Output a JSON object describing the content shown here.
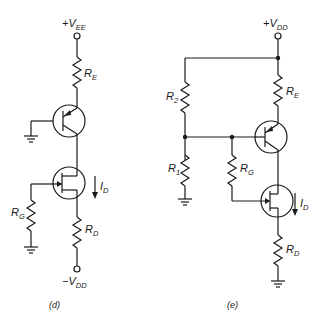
{
  "figure": {
    "type": "circuit-schematic",
    "colors": {
      "ink": "#1a1a1a",
      "background": "#ffffff"
    },
    "circuits": [
      {
        "id": "d",
        "caption": "(d)",
        "supply_top": {
          "main": "+V",
          "sub": "EE"
        },
        "supply_bottom": {
          "main": "−V",
          "sub": "DD"
        },
        "resistors": [
          {
            "main": "R",
            "sub": "E"
          },
          {
            "main": "R",
            "sub": "G"
          },
          {
            "main": "R",
            "sub": "D"
          }
        ],
        "current": {
          "main": "I",
          "sub": "D"
        },
        "components": [
          "pnp-bjt",
          "n-channel-jfet",
          "ground",
          "ground"
        ]
      },
      {
        "id": "e",
        "caption": "(e)",
        "supply_top": {
          "main": "+V",
          "sub": "DD"
        },
        "resistors": [
          {
            "main": "R",
            "sub": "2"
          },
          {
            "main": "R",
            "sub": "1"
          },
          {
            "main": "R",
            "sub": "E"
          },
          {
            "main": "R",
            "sub": "G"
          },
          {
            "main": "R",
            "sub": "D"
          }
        ],
        "current": {
          "main": "I",
          "sub": "D"
        },
        "components": [
          "pnp-bjt",
          "n-channel-jfet",
          "ground",
          "ground"
        ]
      }
    ]
  }
}
